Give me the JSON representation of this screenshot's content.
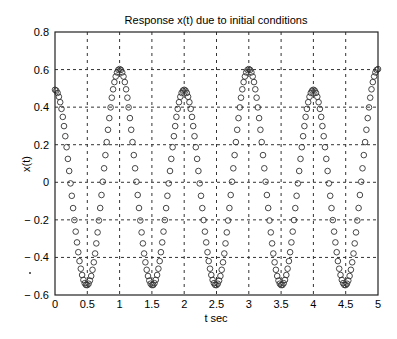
{
  "chart_data": {
    "type": "scatter",
    "title": "Response x(t) due to initial conditions",
    "xlabel": "t sec",
    "ylabel": "x(t)",
    "xlim": [
      0,
      5
    ],
    "ylim": [
      -0.6,
      0.8
    ],
    "xticks": [
      0,
      0.5,
      1,
      1.5,
      2,
      2.5,
      3,
      3.5,
      4,
      4.5,
      5
    ],
    "xtick_labels": [
      "0",
      "0.5",
      "1",
      "1.5",
      "2",
      "2.5",
      "3",
      "3.5",
      "4",
      "4.5",
      "5"
    ],
    "yticks": [
      -0.6,
      -0.4,
      -0.2,
      0,
      0.2,
      0.4,
      0.6,
      0.8
    ],
    "ytick_labels": [
      "-0.6",
      "-0.4",
      "-0.2",
      "0",
      "0.2",
      "0.4",
      "0.6",
      "0.8"
    ],
    "grid": true,
    "grid_style": "dashed",
    "marker": "circle-open",
    "legend": null,
    "series": [
      {
        "name": "x(t)",
        "model": "x(t) ≈ 0.5475·cos(2πt) − 0.055·cos(πt)",
        "sample_step": 0.02,
        "key_points": [
          {
            "t": 0,
            "x": 0.49
          },
          {
            "t": 0.5,
            "x": -0.55
          },
          {
            "t": 1,
            "x": 0.6
          },
          {
            "t": 1.5,
            "x": -0.55
          },
          {
            "t": 2,
            "x": 0.49
          },
          {
            "t": 2.5,
            "x": -0.55
          },
          {
            "t": 3,
            "x": 0.6
          },
          {
            "t": 3.5,
            "x": -0.55
          },
          {
            "t": 4,
            "x": 0.49
          },
          {
            "t": 4.5,
            "x": -0.55
          },
          {
            "t": 5,
            "x": 0.6
          }
        ]
      }
    ],
    "colors": {
      "marker": "#333333",
      "grid": "#333333",
      "axes": "#222222"
    }
  }
}
